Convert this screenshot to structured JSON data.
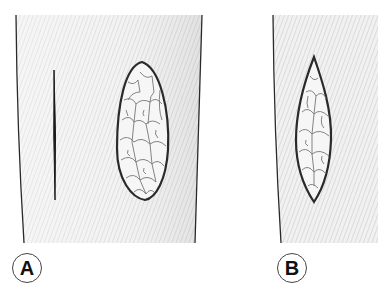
{
  "figure": {
    "panels": [
      {
        "id": "A",
        "label": "A",
        "description": "Skin with linear incision and elliptical granulating wound",
        "elements": [
          "incision-line",
          "elliptical-wound"
        ]
      },
      {
        "id": "B",
        "label": "B",
        "description": "Skin with fusiform (pointed ellipse) granulating wound",
        "elements": [
          "fusiform-wound"
        ]
      }
    ],
    "colors": {
      "skin": "#ececec",
      "hatch": "#d4d4d4",
      "outline": "#2a2a2a",
      "wound_fill": "#f4f4f4",
      "wound_cells": "#6a6a6a"
    }
  }
}
